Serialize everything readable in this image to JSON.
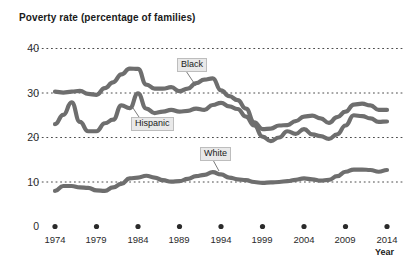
{
  "chart_data": {
    "type": "line",
    "title": "Poverty rate (percentage of families)",
    "xlabel": "Year",
    "ylabel": "",
    "xlim": [
      1973,
      2015
    ],
    "ylim": [
      0,
      42
    ],
    "grid": "dotted-horizontal",
    "legend_position": "inline-annotations",
    "y_ticks": [
      "40",
      "30",
      "20",
      "10",
      "0"
    ],
    "y_tick_values": [
      40,
      30,
      20,
      10,
      0
    ],
    "x_ticks": [
      "1974",
      "1979",
      "1984",
      "1989",
      "1994",
      "1999",
      "2004",
      "2009",
      "2014"
    ],
    "x_tick_values": [
      1974,
      1979,
      1984,
      1989,
      1994,
      1999,
      2004,
      2009,
      2014
    ],
    "line_color": "#6e6e6e",
    "series": [
      {
        "name": "Black",
        "label": "Black",
        "color": "#6e6e6e",
        "x": [
          1974,
          1975,
          1976,
          1977,
          1978,
          1979,
          1980,
          1981,
          1982,
          1983,
          1984,
          1985,
          1986,
          1987,
          1988,
          1989,
          1990,
          1991,
          1992,
          1993,
          1994,
          1995,
          1996,
          1997,
          1998,
          1999,
          2000,
          2001,
          2002,
          2003,
          2004,
          2005,
          2006,
          2007,
          2008,
          2009,
          2010,
          2011,
          2012,
          2013,
          2014
        ],
        "values": [
          30.3,
          30.1,
          30.3,
          30.5,
          29.8,
          29.6,
          31.1,
          32.4,
          34.2,
          35.5,
          35.4,
          31.9,
          31.0,
          31.0,
          31.3,
          30.4,
          31.0,
          32.2,
          33.0,
          33.3,
          30.6,
          29.3,
          28.4,
          26.5,
          23.4,
          21.9,
          22.0,
          22.7,
          22.8,
          23.7,
          24.7,
          24.9,
          24.3,
          23.3,
          24.6,
          25.8,
          27.4,
          27.6,
          27.2,
          26.2,
          26.2
        ]
      },
      {
        "name": "Hispanic",
        "label": "Hispanic",
        "color": "#6e6e6e",
        "x": [
          1974,
          1975,
          1976,
          1977,
          1978,
          1979,
          1980,
          1981,
          1982,
          1983,
          1984,
          1985,
          1986,
          1987,
          1988,
          1989,
          1990,
          1991,
          1992,
          1993,
          1994,
          1995,
          1996,
          1997,
          1998,
          1999,
          2000,
          2001,
          2002,
          2003,
          2004,
          2005,
          2006,
          2007,
          2008,
          2009,
          2010,
          2011,
          2012,
          2013,
          2014
        ],
        "values": [
          23.0,
          25.1,
          27.9,
          23.5,
          21.4,
          21.4,
          23.2,
          24.0,
          27.2,
          26.6,
          29.9,
          26.5,
          25.5,
          25.8,
          26.2,
          25.8,
          26.0,
          26.5,
          26.2,
          27.3,
          27.8,
          27.0,
          26.4,
          24.7,
          22.7,
          20.2,
          19.2,
          20.0,
          21.4,
          20.8,
          21.9,
          20.7,
          20.3,
          19.7,
          20.7,
          22.7,
          25.0,
          24.8,
          24.3,
          23.5,
          23.6
        ]
      },
      {
        "name": "White",
        "label": "White",
        "color": "#6e6e6e",
        "x": [
          1974,
          1975,
          1976,
          1977,
          1978,
          1979,
          1980,
          1981,
          1982,
          1983,
          1984,
          1985,
          1986,
          1987,
          1988,
          1989,
          1990,
          1991,
          1992,
          1993,
          1994,
          1995,
          1996,
          1997,
          1998,
          1999,
          2000,
          2001,
          2002,
          2003,
          2004,
          2005,
          2006,
          2007,
          2008,
          2009,
          2010,
          2011,
          2012,
          2013,
          2014
        ],
        "values": [
          8.0,
          9.1,
          9.1,
          8.8,
          8.7,
          8.1,
          8.0,
          8.8,
          9.6,
          10.8,
          11.0,
          11.4,
          11.0,
          10.4,
          10.1,
          10.2,
          10.7,
          11.3,
          11.6,
          12.2,
          11.7,
          11.0,
          10.6,
          10.4,
          10.0,
          9.8,
          9.9,
          10.0,
          10.2,
          10.5,
          10.8,
          10.6,
          10.3,
          10.5,
          11.3,
          12.3,
          12.8,
          12.8,
          12.7,
          12.3,
          12.7
        ]
      }
    ],
    "annotations": [
      {
        "name": "Black",
        "text": "Black"
      },
      {
        "name": "Hispanic",
        "text": "Hispanic"
      },
      {
        "name": "White",
        "text": "White"
      }
    ]
  },
  "axis": {
    "x_title": "Year"
  }
}
